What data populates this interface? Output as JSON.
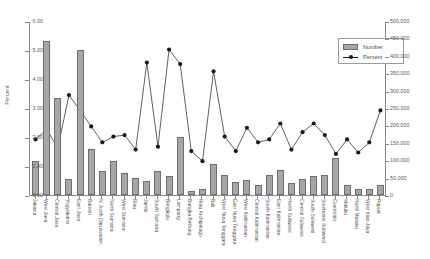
{
  "title": "Number and Percent of Population",
  "legend": {
    "position": "top-right",
    "items": [
      {
        "label": "Number",
        "type": "bar",
        "color": "#a6a6a6"
      },
      {
        "label": "Percent",
        "type": "line",
        "color": "#1c1c1c"
      }
    ]
  },
  "axes": {
    "left": {
      "label": "Percent",
      "ticks": [
        "0.00",
        "1.00",
        "2.00",
        "3.00",
        "4.00",
        "5.00",
        "6.00"
      ],
      "min": 0,
      "max": 6,
      "step": 1
    },
    "right": {
      "label": "",
      "ticks": [
        "0",
        "50,000",
        "100,000",
        "150,000",
        "200,000",
        "250,000",
        "300,000",
        "350,000",
        "400,000",
        "450,000",
        "500,000"
      ],
      "min": 0,
      "max": 500000,
      "step": 50000
    }
  },
  "chart_data": {
    "type": "bar",
    "title": "Number and Percent of Population",
    "xlabel": "",
    "ylabel": "Percent",
    "ylim": [
      0,
      6
    ],
    "y2lim": [
      0,
      500000
    ],
    "grid": false,
    "legend_position": "top-right",
    "categories": [
      "Jakarta",
      "West Java",
      "Central Java",
      "Yogyakarta",
      "East Java",
      "Banten",
      "N. Aceh Darussalam",
      "North Sumatra",
      "West Sumatra",
      "Riau",
      "Jambi",
      "South Sumatra",
      "Bengkulu",
      "Lampung",
      "Bangka Belitung",
      "Riau Archipelago",
      "Bali",
      "West Nusa Tenggara",
      "East Nusa Tenggara",
      "West Kalimantan",
      "Central Kalimantan",
      "South Kalimantan",
      "East Kalimantan",
      "North Sulawesi",
      "Central Sulawesi",
      "South Sulawesi",
      "Southeast Sulawesi",
      "Gorontalo",
      "Maluku",
      "North Maluku",
      "West Irian Jaya",
      "Papua"
    ],
    "series": [
      {
        "name": "Number",
        "axis": "right",
        "type": "bar",
        "values": [
          98000,
          442000,
          278000,
          45000,
          418000,
          132000,
          70000,
          98000,
          62000,
          48000,
          40000,
          70000,
          55000,
          168000,
          12000,
          16000,
          90000,
          58000,
          36000,
          44000,
          30000,
          58000,
          72000,
          34000,
          46000,
          54000,
          58000,
          106000,
          30000,
          18000,
          16000,
          30000
        ]
      },
      {
        "name": "Percent",
        "axis": "left",
        "type": "line",
        "marker": "circle",
        "values": [
          1.95,
          2.3,
          1.65,
          3.48,
          2.95,
          2.4,
          1.85,
          2.05,
          2.1,
          1.6,
          4.6,
          1.7,
          5.05,
          4.55,
          1.55,
          1.2,
          4.3,
          2.05,
          1.55,
          2.35,
          1.85,
          1.95,
          2.5,
          1.6,
          2.2,
          2.5,
          2.1,
          1.45,
          1.95,
          1.5,
          1.85,
          2.95
        ]
      }
    ]
  }
}
